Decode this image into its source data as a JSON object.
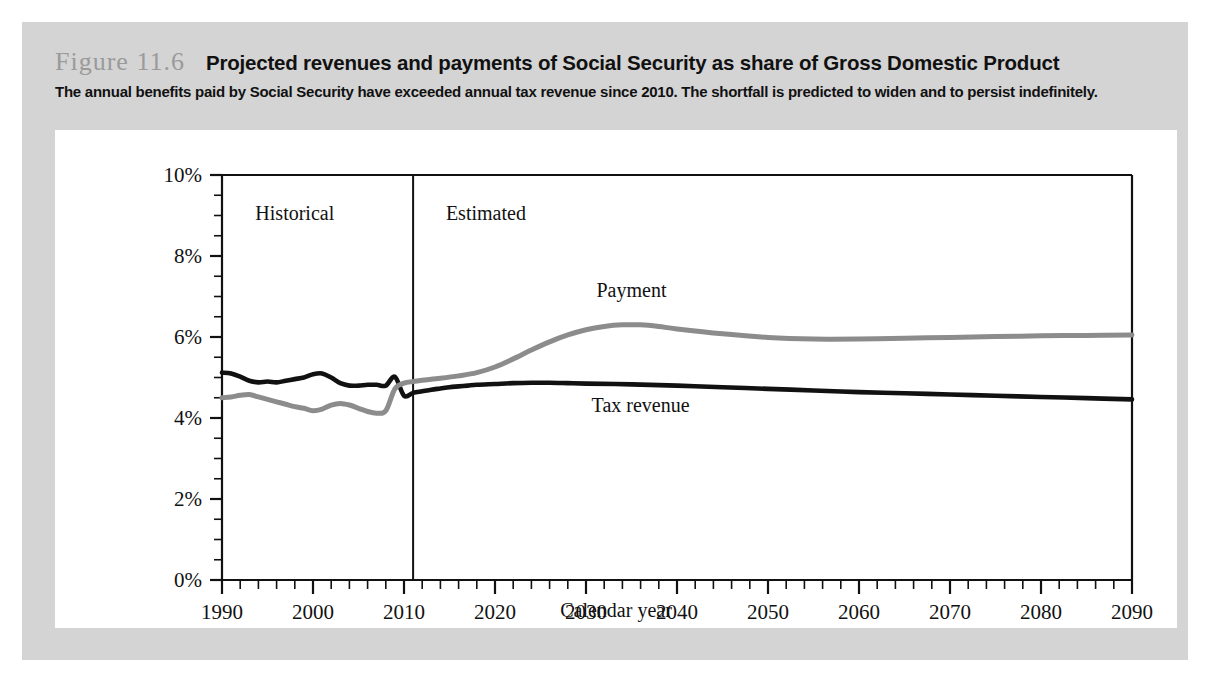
{
  "figure": {
    "number": "Figure 11.6",
    "title": "Projected revenues and payments of Social Security as share of Gross Domestic Product",
    "subtitle": "The annual benefits paid by Social Security have exceeded annual tax revenue since 2010. The shortfall is predicted to widen and to persist indefinitely."
  },
  "colors": {
    "panel_background": "#d4d4d4",
    "card_background": "#ffffff",
    "axis": "#111111",
    "tax_revenue_line": "#111111",
    "payment_line": "#8c8c8c",
    "figure_number_text": "#9a9a9a"
  },
  "chart_data": {
    "type": "line",
    "title": "Projected revenues and payments of Social Security as share of Gross Domestic Product",
    "xlabel": "Calendar year",
    "ylabel": "",
    "xlim": [
      1990,
      2090
    ],
    "ylim": [
      0,
      10
    ],
    "grid": false,
    "legend_position": "inline-annotation",
    "x_tick_labels": [
      "1990",
      "2000",
      "2010",
      "2020",
      "2030",
      "2040",
      "2050",
      "2060",
      "2070",
      "2080",
      "2090"
    ],
    "x_major_ticks": [
      1990,
      2000,
      2010,
      2020,
      2030,
      2040,
      2050,
      2060,
      2070,
      2080,
      2090
    ],
    "x_minor_tick_step": 2,
    "y_tick_labels": [
      "0%",
      "2%",
      "4%",
      "6%",
      "8%",
      "10%"
    ],
    "y_major_ticks": [
      0,
      2,
      4,
      6,
      8,
      10
    ],
    "y_minor_tick_step": 0.5,
    "annotations": [
      {
        "name": "historical-label",
        "text": "Historical",
        "x": 1998,
        "y": 8.9
      },
      {
        "name": "estimated-label",
        "text": "Estimated",
        "x": 2019,
        "y": 8.9
      },
      {
        "name": "payment-label",
        "text": "Payment",
        "x": 2035,
        "y": 7.0
      },
      {
        "name": "tax-revenue-label",
        "text": "Tax revenue",
        "x": 2036,
        "y": 4.15
      }
    ],
    "divider": {
      "name": "historical-estimated-divider",
      "x": 2011,
      "y_from": 0,
      "y_to": 10
    },
    "series": [
      {
        "name": "Tax revenue",
        "color": "#111111",
        "x": [
          1990,
          1991,
          1992,
          1993,
          1994,
          1995,
          1996,
          1997,
          1998,
          1999,
          2000,
          2001,
          2002,
          2003,
          2004,
          2005,
          2006,
          2007,
          2008,
          2009,
          2010,
          2011,
          2012,
          2013,
          2014,
          2015,
          2016,
          2017,
          2018,
          2020,
          2022,
          2024,
          2026,
          2028,
          2030,
          2035,
          2040,
          2045,
          2050,
          2055,
          2060,
          2065,
          2070,
          2075,
          2080,
          2085,
          2090
        ],
        "values": [
          5.12,
          5.1,
          5.02,
          4.92,
          4.88,
          4.9,
          4.88,
          4.92,
          4.96,
          5.0,
          5.08,
          5.1,
          5.0,
          4.86,
          4.8,
          4.8,
          4.82,
          4.82,
          4.8,
          5.02,
          4.55,
          4.62,
          4.66,
          4.7,
          4.73,
          4.76,
          4.78,
          4.8,
          4.82,
          4.84,
          4.86,
          4.87,
          4.87,
          4.86,
          4.85,
          4.83,
          4.8,
          4.76,
          4.72,
          4.68,
          4.64,
          4.61,
          4.58,
          4.55,
          4.52,
          4.49,
          4.46
        ]
      },
      {
        "name": "Payment",
        "color": "#8c8c8c",
        "x": [
          1990,
          1991,
          1992,
          1993,
          1994,
          1995,
          1996,
          1997,
          1998,
          1999,
          2000,
          2001,
          2002,
          2003,
          2004,
          2005,
          2006,
          2007,
          2008,
          2009,
          2010,
          2011,
          2012,
          2014,
          2016,
          2018,
          2020,
          2022,
          2024,
          2026,
          2028,
          2030,
          2032,
          2034,
          2036,
          2038,
          2040,
          2045,
          2050,
          2055,
          2060,
          2065,
          2070,
          2075,
          2080,
          2085,
          2090
        ],
        "values": [
          4.5,
          4.52,
          4.56,
          4.58,
          4.52,
          4.46,
          4.4,
          4.34,
          4.28,
          4.24,
          4.18,
          4.22,
          4.32,
          4.36,
          4.32,
          4.24,
          4.16,
          4.12,
          4.18,
          4.72,
          4.86,
          4.9,
          4.93,
          4.98,
          5.04,
          5.12,
          5.26,
          5.46,
          5.68,
          5.88,
          6.05,
          6.18,
          6.26,
          6.3,
          6.3,
          6.26,
          6.2,
          6.08,
          5.99,
          5.95,
          5.95,
          5.97,
          5.99,
          6.01,
          6.03,
          6.04,
          6.05
        ]
      }
    ]
  }
}
